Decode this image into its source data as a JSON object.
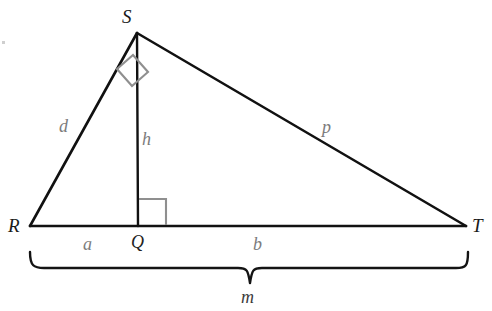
{
  "figure": {
    "kind": "right-triangle-with-altitude",
    "stroke_color": "#111111",
    "marker_color": "#8a8a8a",
    "background": "#ffffff"
  },
  "vertices": {
    "S": {
      "label": "S",
      "x": 137,
      "y": 33
    },
    "R": {
      "label": "R",
      "x": 30,
      "y": 226
    },
    "T": {
      "label": "T",
      "x": 466,
      "y": 226
    },
    "Q": {
      "label": "Q",
      "x": 138,
      "y": 226
    }
  },
  "segments": {
    "d": {
      "label": "d",
      "from": "R",
      "to": "S"
    },
    "p": {
      "label": "p",
      "from": "S",
      "to": "T"
    },
    "h": {
      "label": "h",
      "from": "S",
      "to": "Q"
    },
    "a": {
      "label": "a",
      "from": "R",
      "to": "Q"
    },
    "b": {
      "label": "b",
      "from": "Q",
      "to": "T"
    },
    "m": {
      "label": "m",
      "from": "R",
      "to": "T"
    }
  },
  "right_angles": [
    {
      "at": "S",
      "name": "right-angle-at-s"
    },
    {
      "at": "Q",
      "name": "right-angle-at-q"
    }
  ],
  "brace": {
    "label": "m",
    "spans": "R to T"
  },
  "label_positions": {
    "S": {
      "left": 122,
      "top": 7
    },
    "R": {
      "left": 8,
      "top": 216
    },
    "T": {
      "left": 472,
      "top": 216
    },
    "Q": {
      "left": 131,
      "top": 233
    },
    "d": {
      "left": 59,
      "top": 117
    },
    "h": {
      "left": 142,
      "top": 130
    },
    "p": {
      "left": 322,
      "top": 118
    },
    "a": {
      "left": 83,
      "top": 235
    },
    "b": {
      "left": 253,
      "top": 235
    },
    "m": {
      "left": 241,
      "top": 288
    }
  }
}
